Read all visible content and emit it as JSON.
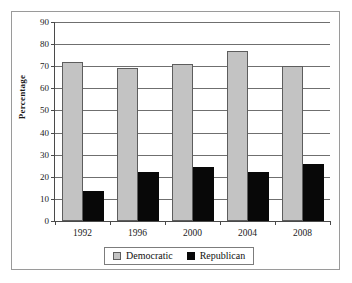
{
  "figure": {
    "y_axis_title": "Percentage"
  },
  "legend": {
    "items": [
      {
        "label": "Democratic",
        "color": "#c3c3c3"
      },
      {
        "label": "Republican",
        "color": "#080808"
      }
    ]
  },
  "axis": {
    "y_ticks": [
      "0",
      "10",
      "20",
      "30",
      "40",
      "50",
      "60",
      "70",
      "80",
      "90"
    ],
    "x_ticks": [
      "1992",
      "1996",
      "2000",
      "2004",
      "2008"
    ]
  },
  "chart_data": {
    "type": "bar",
    "title": "",
    "xlabel": "",
    "ylabel": "Percentage",
    "ylim": [
      0,
      90
    ],
    "ytick_step": 10,
    "grid": true,
    "legend_position": "bottom",
    "categories": [
      "1992",
      "1996",
      "2000",
      "2004",
      "2008"
    ],
    "series": [
      {
        "name": "Democratic",
        "color": "#c3c3c3",
        "values": [
          72,
          69,
          71,
          77,
          70
        ]
      },
      {
        "name": "Republican",
        "color": "#080808",
        "values": [
          13.5,
          22,
          24.5,
          22,
          26
        ]
      }
    ]
  }
}
